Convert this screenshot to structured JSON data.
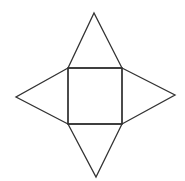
{
  "diagram": {
    "type": "net-of-square-pyramid",
    "faces": [
      {
        "name": "base",
        "shape": "square"
      },
      {
        "name": "top-face",
        "shape": "triangle"
      },
      {
        "name": "right-face",
        "shape": "triangle"
      },
      {
        "name": "bottom-face",
        "shape": "triangle"
      },
      {
        "name": "left-face",
        "shape": "triangle"
      }
    ],
    "line_color": "#333333",
    "background": "#ffffff"
  }
}
